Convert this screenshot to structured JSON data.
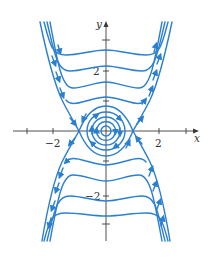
{
  "figure": {
    "type": "phase-portrait",
    "colors": {
      "trajectory": "#2a7fd0",
      "axis": "#3a3a3a",
      "background": "#ffffff"
    },
    "axes": {
      "x_label": "x",
      "y_label": "y",
      "x_tick_labels": [
        "−2",
        "2"
      ],
      "y_tick_labels": [
        "2",
        "−2"
      ],
      "x_ticks": [
        -3,
        -2,
        2,
        3
      ],
      "y_ticks": [
        3,
        2,
        1,
        -1,
        -2,
        -3
      ]
    },
    "equilibria": [
      {
        "type": "center",
        "x": 0,
        "y": 0
      },
      {
        "type": "saddle",
        "x": -1,
        "y": 0
      },
      {
        "type": "saddle",
        "x": 1,
        "y": 0
      }
    ],
    "orbit_direction": "clockwise"
  }
}
